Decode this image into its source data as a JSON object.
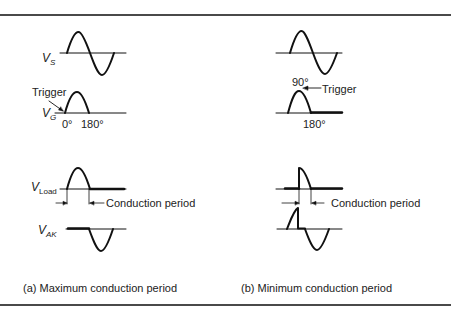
{
  "figure": {
    "panels": [
      {
        "id": "a",
        "caption": "(a) Maximum conduction period",
        "signals": {
          "vs": {
            "label": "V",
            "sub": "S"
          },
          "vg": {
            "label": "V",
            "sub": "G",
            "annotation": "Trigger",
            "ticks": [
              "0°",
              "180°"
            ]
          },
          "vload": {
            "label": "V",
            "sub": "Load",
            "annotation": "Conduction period"
          },
          "vak": {
            "label": "V",
            "sub": "AK"
          }
        }
      },
      {
        "id": "b",
        "caption": "(b) Minimum conduction period",
        "signals": {
          "vg": {
            "annotation": "Trigger",
            "ticks": [
              "90°",
              "180°"
            ]
          },
          "vload": {
            "annotation": "Conduction period"
          }
        }
      }
    ]
  }
}
